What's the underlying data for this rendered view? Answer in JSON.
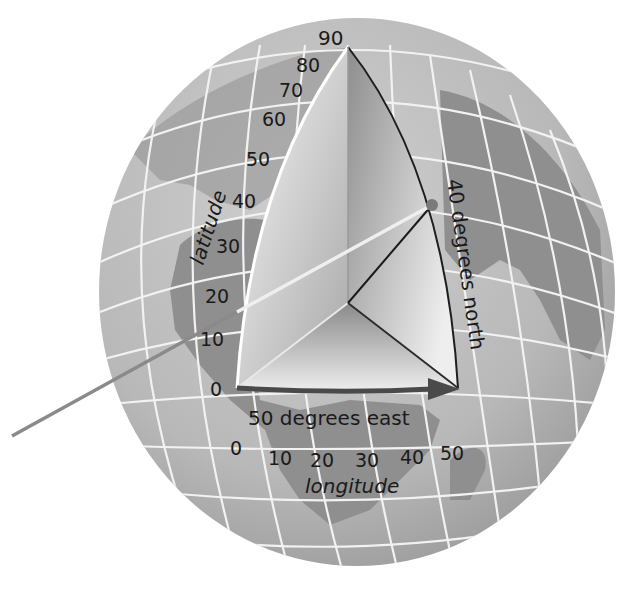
{
  "diagram": {
    "type": "globe-latitude-longitude",
    "colors": {
      "background": "#ffffff",
      "ocean": "#bdbdbd",
      "land": "#8f8f8f",
      "gridline": "#f2f2f2",
      "wedge_light": "#f4f4f4",
      "wedge_dark": "#9a9a9a",
      "edge_dark": "#1e1e1e",
      "pointer": "#8a8a8a",
      "arrow": "#4a4a4a",
      "text": "#1a1a1a"
    },
    "latitude": {
      "axis_label": "latitude",
      "ticks": [
        "0",
        "10",
        "20",
        "30",
        "40",
        "50",
        "60",
        "70",
        "80",
        "90"
      ]
    },
    "longitude": {
      "axis_label": "longitude",
      "ticks": [
        "0",
        "10",
        "20",
        "30",
        "40",
        "50"
      ]
    },
    "annotations": {
      "east": "50 degrees east",
      "north": "40 degrees north"
    },
    "point": {
      "latitude": 40,
      "longitude": 50
    }
  }
}
